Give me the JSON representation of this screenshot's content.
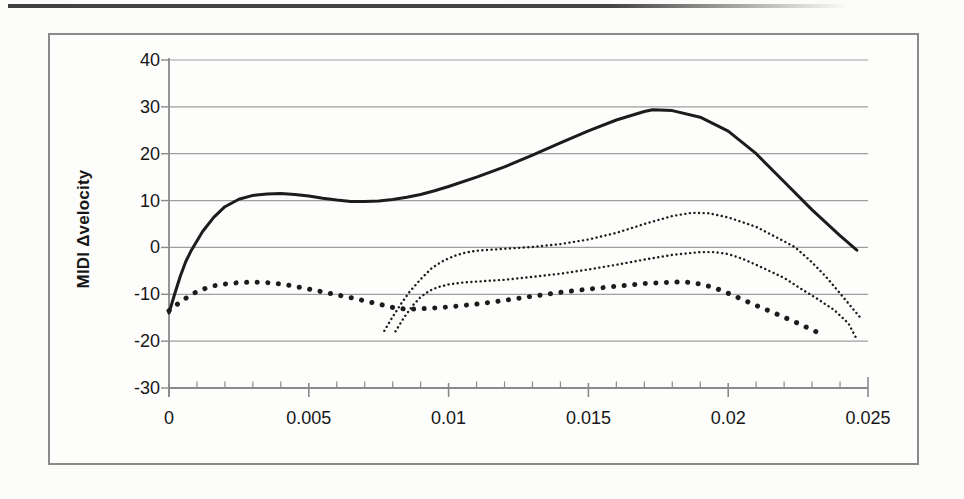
{
  "page": {
    "background": "#fbfbf9"
  },
  "scan_artifact": {
    "description": "dark horizontal smudge line at top edge of scanned page"
  },
  "figure": {
    "border_color": "#8a8a8a",
    "background": "#fdfdfc"
  },
  "chart_data": {
    "type": "line",
    "title": "",
    "xlabel": "",
    "ylabel": "MIDI Δvelocity",
    "xlim": [
      0,
      0.025
    ],
    "ylim": [
      -30,
      40
    ],
    "xticks": [
      0,
      0.005,
      0.01,
      0.015,
      0.02,
      0.025
    ],
    "xtick_labels": [
      "0",
      "0.005",
      "0.01",
      "0.015",
      "0.02",
      "0.025"
    ],
    "x_minor_tick_step": 0.001,
    "yticks": [
      40,
      30,
      20,
      10,
      0,
      -10,
      -20,
      -30
    ],
    "ytick_labels": [
      "40",
      "30",
      "20",
      "10",
      "0",
      "-10",
      "-20",
      "-30"
    ],
    "grid": "horizontal gridlines every 10 units",
    "legend_position": "none",
    "line_color": "#1c1c1c",
    "grid_color": "#9e9e9e",
    "axis_color": "#8a8a8a",
    "text_color": "#161616",
    "series": [
      {
        "name": "solid-curve",
        "style": "solid",
        "points": [
          [
            0,
            -14
          ],
          [
            0.0002,
            -10
          ],
          [
            0.0004,
            -6.2
          ],
          [
            0.0006,
            -3
          ],
          [
            0.0008,
            -0.6
          ],
          [
            0.0012,
            3.4
          ],
          [
            0.0016,
            6.4
          ],
          [
            0.002,
            8.7
          ],
          [
            0.0025,
            10.3
          ],
          [
            0.003,
            11.1
          ],
          [
            0.0035,
            11.4
          ],
          [
            0.004,
            11.5
          ],
          [
            0.0045,
            11.3
          ],
          [
            0.005,
            11
          ],
          [
            0.0055,
            10.5
          ],
          [
            0.006,
            10.1
          ],
          [
            0.0065,
            9.8
          ],
          [
            0.007,
            9.8
          ],
          [
            0.0075,
            9.9
          ],
          [
            0.008,
            10.2
          ],
          [
            0.0085,
            10.7
          ],
          [
            0.009,
            11.3
          ],
          [
            0.0095,
            12.1
          ],
          [
            0.01,
            13
          ],
          [
            0.011,
            15
          ],
          [
            0.012,
            17.2
          ],
          [
            0.013,
            19.7
          ],
          [
            0.014,
            22.3
          ],
          [
            0.015,
            24.9
          ],
          [
            0.016,
            27.2
          ],
          [
            0.017,
            29
          ],
          [
            0.0173,
            29.4
          ],
          [
            0.018,
            29.2
          ],
          [
            0.019,
            27.8
          ],
          [
            0.02,
            24.8
          ],
          [
            0.021,
            20
          ],
          [
            0.022,
            14
          ],
          [
            0.023,
            8
          ],
          [
            0.024,
            2.5
          ],
          [
            0.0246,
            -0.6
          ]
        ]
      },
      {
        "name": "thick-dotted-curve",
        "style": "dotted-thick",
        "points": [
          [
            0,
            -13.5
          ],
          [
            0.0005,
            -11.2
          ],
          [
            0.001,
            -9.4
          ],
          [
            0.0015,
            -8.3
          ],
          [
            0.002,
            -7.8
          ],
          [
            0.0025,
            -7.5
          ],
          [
            0.003,
            -7.4
          ],
          [
            0.0035,
            -7.5
          ],
          [
            0.004,
            -7.8
          ],
          [
            0.0045,
            -8.3
          ],
          [
            0.005,
            -8.9
          ],
          [
            0.0055,
            -9.5
          ],
          [
            0.006,
            -10.1
          ],
          [
            0.0065,
            -10.7
          ],
          [
            0.007,
            -11.4
          ],
          [
            0.0075,
            -12.1
          ],
          [
            0.008,
            -12.8
          ],
          [
            0.0085,
            -13.2
          ],
          [
            0.009,
            -13.1
          ],
          [
            0.0095,
            -12.9
          ],
          [
            0.01,
            -12.7
          ],
          [
            0.011,
            -12.1
          ],
          [
            0.012,
            -11.3
          ],
          [
            0.013,
            -10.4
          ],
          [
            0.014,
            -9.6
          ],
          [
            0.015,
            -8.9
          ],
          [
            0.016,
            -8.3
          ],
          [
            0.017,
            -7.7
          ],
          [
            0.018,
            -7.4
          ],
          [
            0.0185,
            -7.4
          ],
          [
            0.019,
            -7.8
          ],
          [
            0.0195,
            -8.6
          ],
          [
            0.02,
            -9.8
          ],
          [
            0.0205,
            -11.1
          ],
          [
            0.021,
            -12.4
          ],
          [
            0.0215,
            -13.6
          ],
          [
            0.022,
            -14.9
          ],
          [
            0.0225,
            -16.2
          ],
          [
            0.023,
            -17.6
          ],
          [
            0.0233,
            -18.4
          ]
        ]
      },
      {
        "name": "fine-dotted-upper-curve",
        "style": "dotted-fine",
        "points": [
          [
            0.0077,
            -17.8
          ],
          [
            0.008,
            -14.8
          ],
          [
            0.0083,
            -12
          ],
          [
            0.0086,
            -9.5
          ],
          [
            0.009,
            -6.8
          ],
          [
            0.0094,
            -4.4
          ],
          [
            0.0098,
            -2.9
          ],
          [
            0.0102,
            -1.8
          ],
          [
            0.0106,
            -1.1
          ],
          [
            0.011,
            -0.7
          ],
          [
            0.012,
            -0.3
          ],
          [
            0.013,
            0.1
          ],
          [
            0.014,
            0.7
          ],
          [
            0.015,
            1.7
          ],
          [
            0.016,
            3.1
          ],
          [
            0.017,
            5
          ],
          [
            0.018,
            6.7
          ],
          [
            0.0187,
            7.4
          ],
          [
            0.0193,
            7.3
          ],
          [
            0.02,
            6.4
          ],
          [
            0.021,
            4.4
          ],
          [
            0.022,
            1.3
          ],
          [
            0.0224,
            0
          ],
          [
            0.023,
            -3.2
          ],
          [
            0.0235,
            -6.3
          ],
          [
            0.024,
            -9.8
          ],
          [
            0.0247,
            -14.8
          ]
        ]
      },
      {
        "name": "fine-dotted-lower-curve",
        "style": "dotted-fine",
        "points": [
          [
            0.0081,
            -17.9
          ],
          [
            0.0084,
            -15
          ],
          [
            0.0087,
            -12.5
          ],
          [
            0.009,
            -10.6
          ],
          [
            0.0093,
            -9.3
          ],
          [
            0.0096,
            -8.5
          ],
          [
            0.01,
            -7.9
          ],
          [
            0.0105,
            -7.5
          ],
          [
            0.011,
            -7.3
          ],
          [
            0.012,
            -6.9
          ],
          [
            0.013,
            -6.3
          ],
          [
            0.014,
            -5.6
          ],
          [
            0.015,
            -4.7
          ],
          [
            0.016,
            -3.7
          ],
          [
            0.017,
            -2.6
          ],
          [
            0.018,
            -1.6
          ],
          [
            0.019,
            -1
          ],
          [
            0.0195,
            -1
          ],
          [
            0.02,
            -1.4
          ],
          [
            0.0205,
            -2.4
          ],
          [
            0.021,
            -3.7
          ],
          [
            0.0215,
            -5.1
          ],
          [
            0.022,
            -6.5
          ],
          [
            0.0226,
            -8.8
          ],
          [
            0.0232,
            -11
          ],
          [
            0.0238,
            -13.4
          ],
          [
            0.0243,
            -16.2
          ],
          [
            0.0246,
            -19.6
          ]
        ]
      }
    ]
  }
}
